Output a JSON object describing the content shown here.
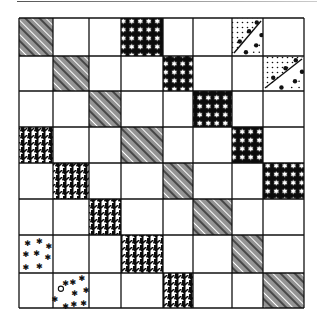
{
  "figure": {
    "title": "",
    "grid": {
      "rows": 8,
      "cols": 8,
      "col_edges": [
        19,
        53,
        89,
        121,
        163,
        193,
        232,
        263,
        304
      ],
      "row_edges": [
        18,
        56,
        91,
        127,
        163,
        199,
        235,
        273,
        308
      ],
      "line_color": "#111111",
      "background": "#ffffff"
    },
    "pattern_legend": {
      "herringbone": "diagonal herringbone hatching",
      "stars": "white stars on black",
      "dots": "dotted with diagonal line of large dots",
      "houndstooth": "black houndstooth",
      "asterisks": "scattered asterisks",
      "asterisks-circle": "scattered asterisks with small circle"
    },
    "cells": [
      {
        "row": 0,
        "col": 0,
        "pattern": "herringbone"
      },
      {
        "row": 0,
        "col": 3,
        "pattern": "stars"
      },
      {
        "row": 0,
        "col": 6,
        "pattern": "dots"
      },
      {
        "row": 1,
        "col": 1,
        "pattern": "herringbone"
      },
      {
        "row": 1,
        "col": 4,
        "pattern": "stars"
      },
      {
        "row": 1,
        "col": 7,
        "pattern": "dots"
      },
      {
        "row": 2,
        "col": 2,
        "pattern": "herringbone"
      },
      {
        "row": 2,
        "col": 5,
        "pattern": "stars"
      },
      {
        "row": 3,
        "col": 0,
        "pattern": "houndstooth"
      },
      {
        "row": 3,
        "col": 3,
        "pattern": "herringbone"
      },
      {
        "row": 3,
        "col": 6,
        "pattern": "stars"
      },
      {
        "row": 4,
        "col": 1,
        "pattern": "houndstooth"
      },
      {
        "row": 4,
        "col": 4,
        "pattern": "herringbone"
      },
      {
        "row": 4,
        "col": 7,
        "pattern": "stars"
      },
      {
        "row": 5,
        "col": 2,
        "pattern": "houndstooth"
      },
      {
        "row": 5,
        "col": 5,
        "pattern": "herringbone"
      },
      {
        "row": 6,
        "col": 0,
        "pattern": "asterisks"
      },
      {
        "row": 6,
        "col": 3,
        "pattern": "houndstooth"
      },
      {
        "row": 6,
        "col": 6,
        "pattern": "herringbone"
      },
      {
        "row": 7,
        "col": 1,
        "pattern": "asterisks-circle"
      },
      {
        "row": 7,
        "col": 4,
        "pattern": "houndstooth"
      },
      {
        "row": 7,
        "col": 7,
        "pattern": "herringbone"
      }
    ]
  }
}
